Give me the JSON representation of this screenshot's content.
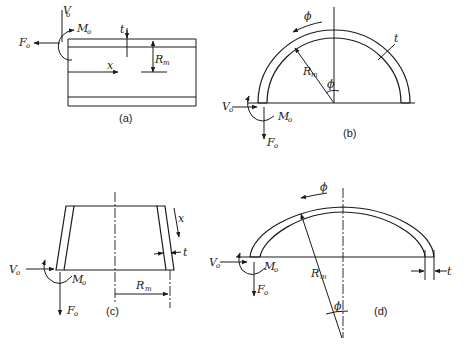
{
  "figure": {
    "panels": [
      {
        "id": "a",
        "caption": "(a)",
        "shape": "cylindrical shell (longitudinal section)",
        "labels": {
          "shear": "V",
          "shear_sub": "o",
          "force": "F",
          "force_sub": "o",
          "moment": "M",
          "moment_sub": "o",
          "thickness": "t",
          "radius": "R",
          "radius_sub": "m",
          "axis": "x"
        }
      },
      {
        "id": "b",
        "caption": "(b)",
        "shape": "hemispherical shell",
        "labels": {
          "angle_top": "ϕ",
          "angle_center": "ϕ",
          "thickness": "t",
          "radius": "R",
          "radius_sub": "m",
          "shear": "V",
          "shear_sub": "o",
          "moment": "M",
          "moment_sub": "o",
          "force": "F",
          "force_sub": "o"
        }
      },
      {
        "id": "c",
        "caption": "(c)",
        "shape": "conical shell",
        "labels": {
          "axis": "x",
          "thickness": "t",
          "radius": "R",
          "radius_sub": "m",
          "shear": "V",
          "shear_sub": "o",
          "moment": "M",
          "moment_sub": "o",
          "force": "F",
          "force_sub": "o"
        }
      },
      {
        "id": "d",
        "caption": "(d)",
        "shape": "shallow spherical / torispherical head",
        "labels": {
          "angle_top": "ϕ",
          "angle_center": "ϕ",
          "thickness": "t",
          "radius": "R",
          "radius_sub": "m",
          "shear": "V",
          "shear_sub": "o",
          "moment": "M",
          "moment_sub": "o",
          "force": "F",
          "force_sub": "o"
        }
      }
    ]
  }
}
